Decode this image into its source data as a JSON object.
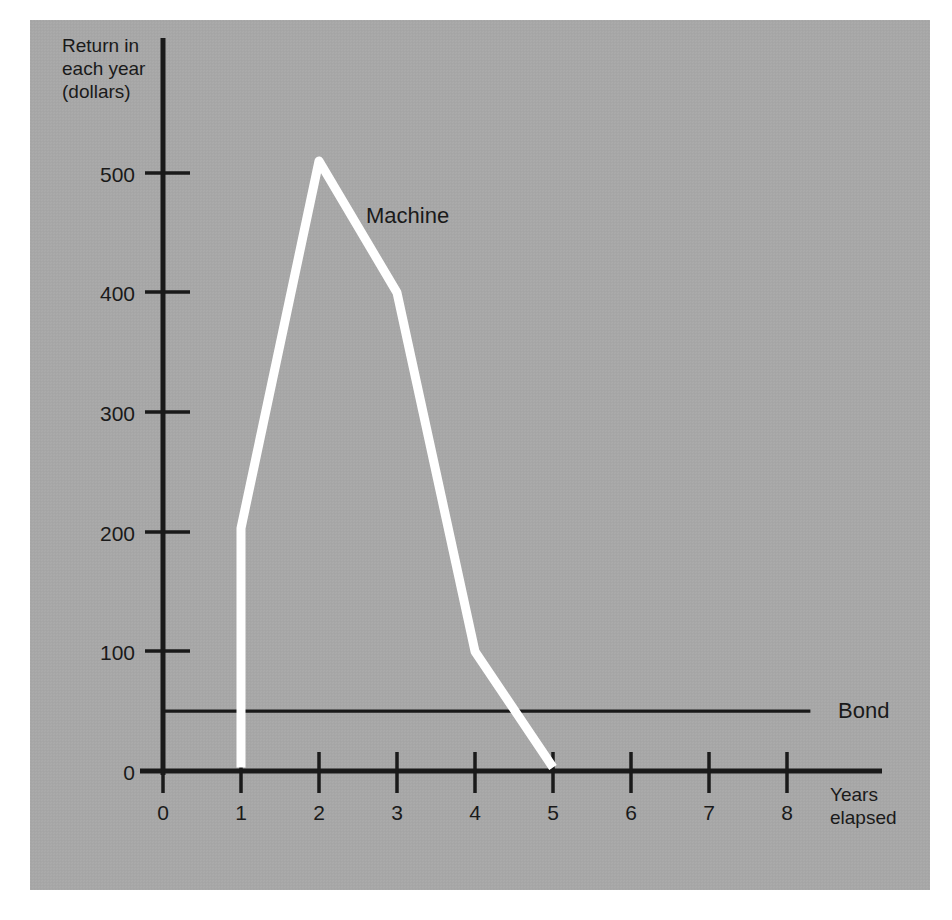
{
  "figure": {
    "background_color": "#a8a8a8",
    "axis_color": "#1a1a1a",
    "machine_line_color": "#ffffff",
    "bond_line_color": "#1a1a1a"
  },
  "labels": {
    "y_axis_title": "Return in\neach year\n(dollars)",
    "x_axis_title": "Years\nelapsed",
    "machine": "Machine",
    "bond": "Bond"
  },
  "chart_data": {
    "type": "line",
    "title": "",
    "subtitle": "",
    "xlabel": "Years elapsed",
    "ylabel": "Return in each year (dollars)",
    "xlim": [
      0,
      8.6
    ],
    "ylim": [
      0,
      560
    ],
    "grid": false,
    "legend": "inline-annotations",
    "x_ticks": [
      0,
      1,
      2,
      3,
      4,
      5,
      6,
      7,
      8
    ],
    "x_tick_labels": [
      "0",
      "1",
      "2",
      "3",
      "4",
      "5",
      "6",
      "7",
      "8"
    ],
    "y_ticks": [
      0,
      100,
      200,
      300,
      400,
      500
    ],
    "y_tick_labels": [
      "0",
      "100",
      "200",
      "300",
      "400",
      "500"
    ],
    "series": [
      {
        "name": "Machine",
        "color": "#ffffff",
        "x": [
          1,
          1,
          2,
          3,
          4,
          5
        ],
        "values": [
          3,
          203,
          510,
          400,
          100,
          3
        ],
        "annotation": "Machine"
      },
      {
        "name": "Bond",
        "color": "#1a1a1a",
        "x": [
          0,
          8.3
        ],
        "values": [
          50,
          50
        ],
        "annotation": "Bond"
      }
    ]
  }
}
